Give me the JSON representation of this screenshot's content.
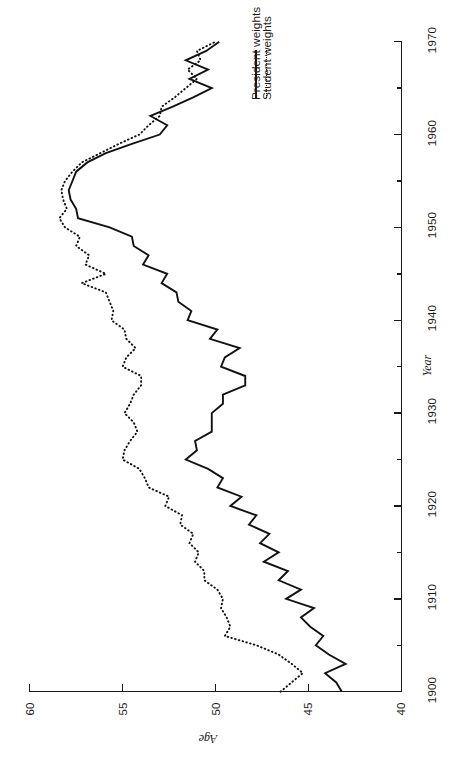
{
  "chart_data": {
    "type": "line",
    "title": "",
    "subtitle": "",
    "xlabel": "Year",
    "ylabel": "Age",
    "xlim": [
      1900,
      1970
    ],
    "ylim": [
      40,
      60
    ],
    "grid": false,
    "orientation": "rotated-90-clockwise",
    "legend_position": "middle-right",
    "xticks": [
      1900,
      1910,
      1920,
      1930,
      1940,
      1950,
      1960,
      1970
    ],
    "xticks_minor": [
      1905,
      1915,
      1925,
      1935,
      1945,
      1955,
      1965
    ],
    "yticks": [
      40,
      45,
      50,
      55,
      60
    ],
    "series": [
      {
        "name": "President weights",
        "style": "solid",
        "x": [
          1900,
          1901,
          1902,
          1903,
          1904,
          1905,
          1906,
          1907,
          1908,
          1909,
          1910,
          1911,
          1912,
          1913,
          1914,
          1915,
          1916,
          1917,
          1918,
          1919,
          1920,
          1921,
          1922,
          1923,
          1924,
          1925,
          1926,
          1927,
          1928,
          1929,
          1930,
          1931,
          1932,
          1933,
          1934,
          1935,
          1936,
          1937,
          1938,
          1939,
          1940,
          1941,
          1942,
          1943,
          1944,
          1945,
          1946,
          1947,
          1948,
          1949,
          1950,
          1951,
          1952,
          1953,
          1954,
          1955,
          1956,
          1957,
          1958,
          1959,
          1960,
          1961,
          1962,
          1963,
          1964,
          1965,
          1966,
          1967,
          1968,
          1969,
          1970
        ],
        "values": [
          43.2,
          43.5,
          44.1,
          43.0,
          43.9,
          44.6,
          44.2,
          44.9,
          45.4,
          44.7,
          46.2,
          45.4,
          46.6,
          46.1,
          47.4,
          46.6,
          47.6,
          47.1,
          48.2,
          47.8,
          49.2,
          48.6,
          49.9,
          49.6,
          50.4,
          51.6,
          51.0,
          51.1,
          50.2,
          50.2,
          50.2,
          49.6,
          49.6,
          48.4,
          48.4,
          49.7,
          49.5,
          48.7,
          50.3,
          49.9,
          51.5,
          51.3,
          52.0,
          52.1,
          52.9,
          52.6,
          53.9,
          53.6,
          54.4,
          54.5,
          55.7,
          57.4,
          57.5,
          57.8,
          57.9,
          57.7,
          57.5,
          56.9,
          55.9,
          54.5,
          53.0,
          52.6,
          53.5,
          52.3,
          51.2,
          50.2,
          51.4,
          50.4,
          51.6,
          50.5,
          49.8
        ]
      },
      {
        "name": "Student weights",
        "style": "dotted",
        "x": [
          1900,
          1901,
          1902,
          1903,
          1904,
          1905,
          1906,
          1907,
          1908,
          1909,
          1910,
          1911,
          1912,
          1913,
          1914,
          1915,
          1916,
          1917,
          1918,
          1919,
          1920,
          1921,
          1922,
          1923,
          1924,
          1925,
          1926,
          1927,
          1928,
          1929,
          1930,
          1931,
          1932,
          1933,
          1934,
          1935,
          1936,
          1937,
          1938,
          1939,
          1940,
          1941,
          1942,
          1943,
          1944,
          1945,
          1946,
          1947,
          1948,
          1949,
          1950,
          1951,
          1952,
          1953,
          1954,
          1955,
          1956,
          1957,
          1958,
          1959,
          1960,
          1961,
          1962,
          1963,
          1964,
          1965,
          1966,
          1967,
          1968,
          1969,
          1970
        ],
        "values": [
          46.5,
          45.9,
          45.3,
          45.9,
          46.6,
          47.8,
          49.5,
          49.2,
          49.4,
          49.7,
          49.6,
          49.9,
          50.6,
          50.6,
          51.1,
          50.9,
          51.4,
          51.2,
          51.9,
          51.8,
          52.7,
          52.5,
          53.6,
          53.8,
          54.1,
          55.0,
          54.9,
          54.6,
          54.2,
          54.4,
          54.9,
          54.6,
          54.4,
          54.0,
          54.0,
          55.0,
          54.8,
          54.3,
          54.8,
          54.9,
          55.6,
          55.5,
          55.7,
          55.9,
          57.2,
          55.9,
          57.0,
          56.8,
          57.5,
          57.3,
          58.1,
          58.4,
          58.0,
          58.2,
          58.3,
          58.1,
          57.7,
          57.2,
          56.2,
          55.2,
          54.1,
          53.6,
          53.0,
          52.9,
          52.2,
          51.6,
          51.0,
          51.5,
          50.8,
          51.0,
          50.0
        ]
      }
    ]
  },
  "axes": {
    "age": {
      "title": "Age",
      "ticks": [
        {
          "label": "60",
          "value": 60
        },
        {
          "label": "55",
          "value": 55
        },
        {
          "label": "50",
          "value": 50
        },
        {
          "label": "45",
          "value": 45
        },
        {
          "label": "40",
          "value": 40
        }
      ]
    },
    "year": {
      "title": "Year",
      "ticks": [
        {
          "label": "1900",
          "value": 1900
        },
        {
          "label": "1910",
          "value": 1910
        },
        {
          "label": "1920",
          "value": 1920
        },
        {
          "label": "1930",
          "value": 1930
        },
        {
          "label": "1940",
          "value": 1940
        },
        {
          "label": "1950",
          "value": 1950
        },
        {
          "label": "1960",
          "value": 1960
        },
        {
          "label": "1970",
          "value": 1970
        }
      ]
    }
  },
  "legend": {
    "entries": [
      {
        "label": "President weights",
        "style": "solid"
      },
      {
        "label": "Student weights",
        "style": "dotted"
      }
    ]
  },
  "colors": {
    "ink": "#1a1a1a",
    "series": "#121212",
    "background": "#ffffff"
  }
}
